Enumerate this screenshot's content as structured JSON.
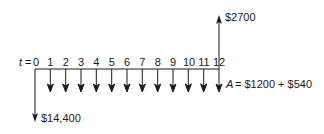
{
  "diagram": {
    "type": "cash-flow",
    "time_label": "t",
    "equals": "=",
    "periods": [
      "0",
      "1",
      "2",
      "3",
      "4",
      "5",
      "6",
      "7",
      "8",
      "9",
      "10",
      "11",
      "12"
    ],
    "initial_outflow": {
      "period": 0,
      "label": "$14,400"
    },
    "final_inflow": {
      "period": 12,
      "label": "$2700"
    },
    "annuity": {
      "symbol": "A",
      "label": "= $1200 + $540",
      "periods": "1-12"
    }
  },
  "colors": {
    "line": "#1a1a1a",
    "background": "#ffffff"
  }
}
